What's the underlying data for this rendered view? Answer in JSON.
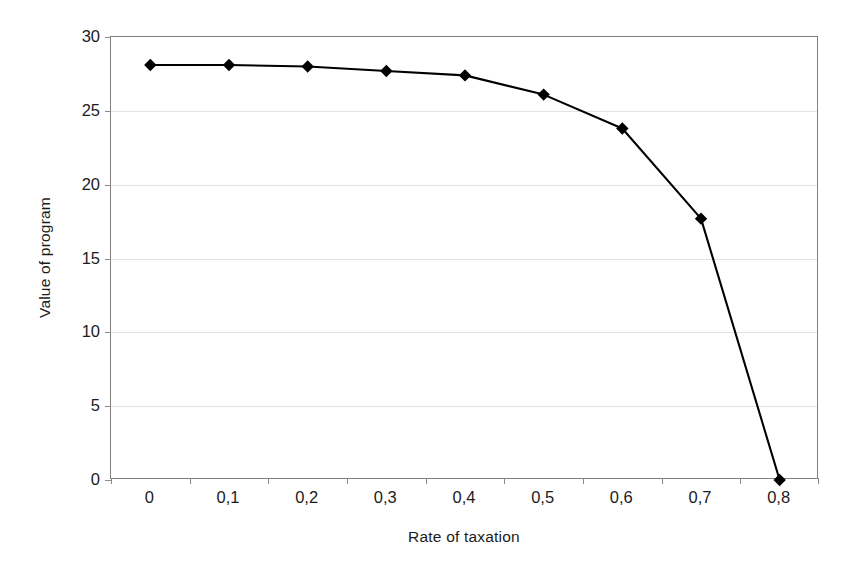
{
  "chart_data": {
    "type": "line",
    "title": "",
    "subtitle": "",
    "xlabel": "Rate of taxation",
    "ylabel": "Value of program",
    "categories": [
      "0",
      "0,1",
      "0,2",
      "0,3",
      "0,4",
      "0,5",
      "0,6",
      "0,7",
      "0,8"
    ],
    "x": [
      0,
      0.1,
      0.2,
      0.3,
      0.4,
      0.5,
      0.6,
      0.7,
      0.8
    ],
    "values": [
      28.1,
      28.1,
      28.0,
      27.7,
      27.4,
      26.1,
      23.8,
      17.7,
      0.0
    ],
    "series": [
      {
        "name": "Value of program",
        "values": [
          28.1,
          28.1,
          28.0,
          27.7,
          27.4,
          26.1,
          23.8,
          17.7,
          0.0
        ]
      }
    ],
    "ylim": [
      0,
      30
    ],
    "y_ticks": [
      0,
      5,
      10,
      15,
      20,
      25,
      30
    ],
    "y_tick_labels": [
      "0",
      "5",
      "10",
      "15",
      "20",
      "25",
      "30"
    ],
    "xlim": [
      -0.05,
      0.85
    ],
    "grid": "horizontal",
    "legend": "none",
    "marker": "diamond",
    "marker_color": "#000000",
    "line_color": "#000000",
    "gridline_color": "#e3e3e3",
    "frame_color": "#808080",
    "background": "#ffffff",
    "annotations": []
  },
  "axes": {
    "x_title": "Rate of taxation",
    "y_title": "Value of program"
  }
}
